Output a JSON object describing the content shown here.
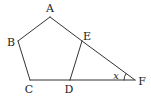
{
  "figure": {
    "type": "geometry",
    "stroke_color": "#333333",
    "points": {
      "A": {
        "x": 50,
        "y": 17,
        "label": "A",
        "lx": 50,
        "ly": 12
      },
      "B": {
        "x": 18,
        "y": 41,
        "label": "B",
        "lx": 11,
        "ly": 46
      },
      "C": {
        "x": 30,
        "y": 80,
        "label": "C",
        "lx": 29,
        "ly": 93
      },
      "D": {
        "x": 70,
        "y": 80,
        "label": "D",
        "lx": 69,
        "ly": 93
      },
      "E": {
        "x": 82,
        "y": 41,
        "label": "E",
        "lx": 87,
        "ly": 40
      },
      "F": {
        "x": 135,
        "y": 80,
        "label": "F",
        "lx": 142,
        "ly": 85
      }
    },
    "segments": [
      [
        "A",
        "B"
      ],
      [
        "B",
        "C"
      ],
      [
        "C",
        "D"
      ],
      [
        "D",
        "E"
      ],
      [
        "E",
        "A"
      ],
      [
        "E",
        "F"
      ],
      [
        "D",
        "F"
      ]
    ],
    "angle": {
      "vertex": "F",
      "label": "x",
      "lx": 116,
      "ly": 80
    }
  }
}
